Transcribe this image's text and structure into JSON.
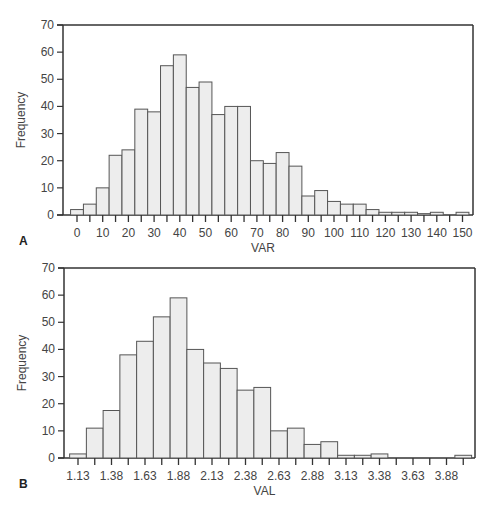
{
  "chart_data": [
    {
      "type": "bar",
      "panel_label": "A",
      "title": "",
      "xlabel": "VAR",
      "ylabel": "Frequency",
      "ylim": [
        0,
        70
      ],
      "yticks": [
        0,
        10,
        20,
        30,
        40,
        50,
        60,
        70
      ],
      "xtick_labels": [
        "0",
        "10",
        "20",
        "30",
        "40",
        "50",
        "60",
        "70",
        "80",
        "90",
        "100",
        "110",
        "120",
        "130",
        "140",
        "150"
      ],
      "bin_width": 5,
      "categories": [
        0,
        5,
        10,
        15,
        20,
        25,
        30,
        35,
        40,
        45,
        50,
        55,
        60,
        65,
        70,
        75,
        80,
        85,
        90,
        95,
        100,
        105,
        110,
        115,
        120,
        125,
        130,
        135,
        140,
        145,
        150
      ],
      "values": [
        2,
        4,
        10,
        22,
        24,
        39,
        38,
        55,
        59,
        47,
        49,
        37,
        40,
        40,
        20,
        19,
        23,
        18,
        7,
        9,
        5,
        4,
        4,
        2,
        1,
        1,
        1,
        0.5,
        1,
        0,
        1
      ],
      "grid": false,
      "legend": null
    },
    {
      "type": "bar",
      "panel_label": "B",
      "title": "",
      "xlabel": "VAL",
      "ylabel": "Frequency",
      "ylim": [
        0,
        70
      ],
      "yticks": [
        0,
        10,
        20,
        30,
        40,
        50,
        60,
        70
      ],
      "xtick_labels": [
        "1.13",
        "1.38",
        "1.63",
        "1.88",
        "2.13",
        "2.38",
        "2.63",
        "2.88",
        "3.13",
        "3.38",
        "3.63",
        "3.88"
      ],
      "bin_width": 0.125,
      "categories": [
        1.13,
        1.255,
        1.38,
        1.505,
        1.63,
        1.755,
        1.88,
        2.005,
        2.13,
        2.255,
        2.38,
        2.505,
        2.63,
        2.755,
        2.88,
        3.005,
        3.13,
        3.255,
        3.38,
        3.505,
        3.63,
        3.755,
        3.88,
        4.005
      ],
      "values": [
        1.5,
        11,
        17.5,
        38,
        43,
        52,
        59,
        40,
        35,
        33,
        25,
        26,
        10,
        11,
        5,
        6,
        1,
        1,
        1.5,
        0,
        0,
        0,
        0,
        1
      ],
      "grid": false,
      "legend": null
    }
  ]
}
